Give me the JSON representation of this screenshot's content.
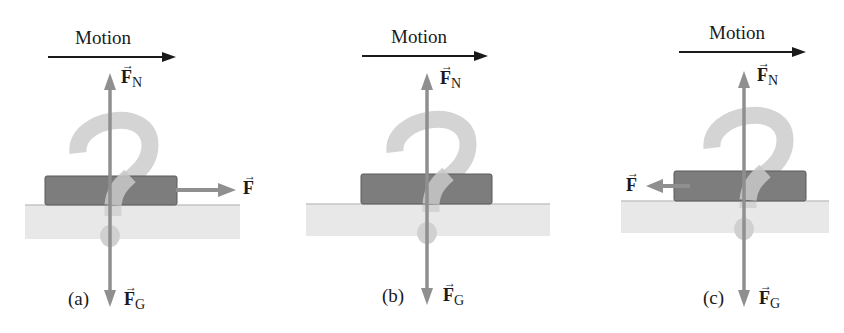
{
  "figure": {
    "colors": {
      "motion_arrow": "#1a1a1a",
      "force_arrow": "#8f8f8f",
      "block_fill": "#7a7a7a",
      "block_border": "#555555",
      "ground": "#e6e6e6",
      "ground_line": "#c8c8c8",
      "question_mark": "#d2d2d2"
    },
    "panels": [
      {
        "id": "a",
        "caption": "(a)",
        "motion_label": "Motion",
        "motion_direction": "right",
        "normal_force_label": "F",
        "normal_force_sub": "N",
        "gravity_force_label": "F",
        "gravity_force_sub": "G",
        "applied_force_label": "F",
        "applied_force_direction": "right",
        "question_mark": "?"
      },
      {
        "id": "b",
        "caption": "(b)",
        "motion_label": "Motion",
        "motion_direction": "right",
        "normal_force_label": "F",
        "normal_force_sub": "N",
        "gravity_force_label": "F",
        "gravity_force_sub": "G",
        "applied_force_label": null,
        "applied_force_direction": "none",
        "question_mark": "?"
      },
      {
        "id": "c",
        "caption": "(c)",
        "motion_label": "Motion",
        "motion_direction": "right",
        "normal_force_label": "F",
        "normal_force_sub": "N",
        "gravity_force_label": "F",
        "gravity_force_sub": "G",
        "applied_force_label": "F",
        "applied_force_direction": "left",
        "question_mark": "?"
      }
    ],
    "vector_arrow_glyph": "→"
  }
}
